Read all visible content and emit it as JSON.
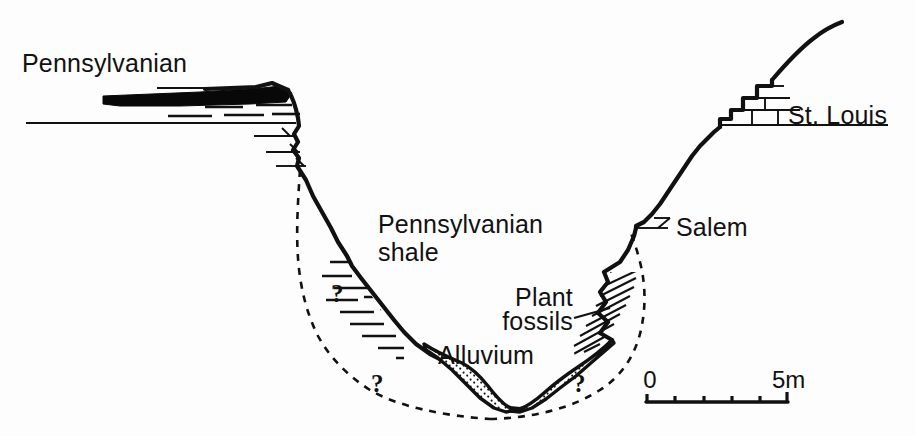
{
  "figure": {
    "type": "geologic-cross-section",
    "background_color": "#fdfdfd",
    "ink_color": "#111111",
    "width": 915,
    "height": 436
  },
  "labels": {
    "pennsylvanian": "Pennsylvanian",
    "pennsylvanian_shale_line1": "Pennsylvanian",
    "pennsylvanian_shale_line2": "shale",
    "alluvium": "Alluvium",
    "plant_fossils_line1": "Plant",
    "plant_fossils_line2": "fossils",
    "salem": "Salem",
    "st_louis": "St. Louis"
  },
  "uncertainty_marks": [
    {
      "id": "q-left-upper",
      "text": "?"
    },
    {
      "id": "q-left-lower",
      "text": "?"
    },
    {
      "id": "q-right-lower",
      "text": "?"
    }
  ],
  "scale_bar": {
    "start_label": "0",
    "end_label": "5m",
    "units": "m",
    "min": 0,
    "max": 5,
    "divisions": 5
  },
  "units_depicted": [
    {
      "name": "Pennsylvanian",
      "symbol": "coal-seam"
    },
    {
      "name": "Pennsylvanian shale",
      "symbol": "horizontal-dashes"
    },
    {
      "name": "Alluvium",
      "symbol": "stipple"
    },
    {
      "name": "Plant fossils",
      "symbol": "diagonal-hatch"
    },
    {
      "name": "Salem",
      "symbol": "limestone-ledge"
    },
    {
      "name": "St. Louis",
      "symbol": "limestone-brick"
    }
  ]
}
